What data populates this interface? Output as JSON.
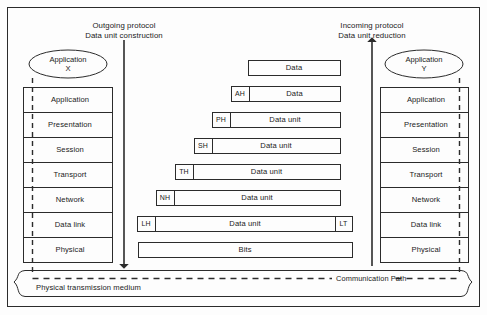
{
  "diagram": {
    "headings": {
      "outgoing_line1": "Outgoing protocol",
      "outgoing_line2": "Data unit construction",
      "incoming_line1": "Incoming protocol",
      "incoming_line2": "Data unit reduction"
    },
    "endpoints": {
      "left_line1": "Application",
      "left_line2": "X",
      "right_line1": "Application",
      "right_line2": "Y"
    },
    "layers": [
      "Application",
      "Presentation",
      "Session",
      "Transport",
      "Network",
      "Data link",
      "Physical"
    ],
    "bottom": {
      "communication_path": "Communication Path",
      "medium": "Physical transmission medium"
    },
    "colors": {
      "line": "#2b2b2b",
      "text": "#1a1a1a",
      "background": "#ffffff"
    }
  },
  "chart_data": {
    "type": "diagram",
    "rows": [
      {
        "layer": "Application",
        "header": "",
        "payload": "Data",
        "trailer": "",
        "x_left": 248,
        "x_right": 340,
        "y_top": 60,
        "height": 15
      },
      {
        "layer": "Presentation",
        "header": "AH",
        "payload": "Data",
        "trailer": "",
        "x_left": 231,
        "x_right": 340,
        "y_top": 86,
        "height": 15
      },
      {
        "layer": "Session",
        "header": "PH",
        "payload": "Data unit",
        "trailer": "",
        "x_left": 212,
        "x_right": 340,
        "y_top": 112,
        "height": 15
      },
      {
        "layer": "Transport",
        "header": "SH",
        "payload": "Data unit",
        "trailer": "",
        "x_left": 194,
        "x_right": 340,
        "y_top": 138,
        "height": 15
      },
      {
        "layer": "Network",
        "header": "TH",
        "payload": "Data unit",
        "trailer": "",
        "x_left": 175,
        "x_right": 340,
        "y_top": 164,
        "height": 15
      },
      {
        "layer": "Data link",
        "header": "NH",
        "payload": "Data unit",
        "trailer": "",
        "x_left": 156,
        "x_right": 340,
        "y_top": 190,
        "height": 15
      },
      {
        "layer": "Physical",
        "header": "LH",
        "payload": "Data unit",
        "trailer": "LT",
        "x_left": 137,
        "x_right": 352,
        "y_top": 216,
        "height": 15
      },
      {
        "layer": "Medium",
        "header": "",
        "payload": "Bits",
        "trailer": "",
        "x_left": 138,
        "x_right": 352,
        "y_top": 242,
        "height": 15
      }
    ],
    "header_labels": [
      "AH",
      "PH",
      "SH",
      "TH",
      "NH",
      "LH"
    ],
    "trailer_labels": [
      "LT"
    ],
    "payload_labels": [
      "Data",
      "Data",
      "Data unit",
      "Data unit",
      "Data unit",
      "Data unit",
      "Data unit",
      "Bits"
    ],
    "arrows": [
      {
        "name": "outgoing",
        "direction": "down",
        "x": 124,
        "y_from": 40,
        "y_to": 268
      },
      {
        "name": "incoming",
        "direction": "up",
        "x": 372,
        "y_from": 268,
        "y_to": 40
      }
    ]
  }
}
